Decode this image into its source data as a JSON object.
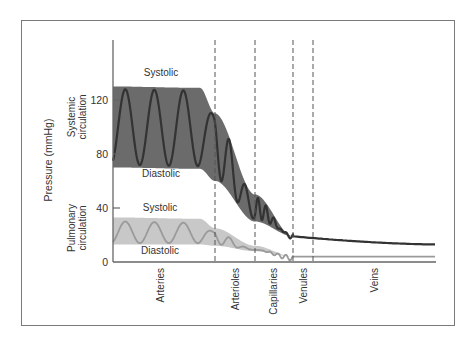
{
  "chart_data": {
    "type": "area",
    "title": "",
    "ylabel": "Pressure (mmHg)",
    "xlabel": "",
    "ylim": [
      0,
      160
    ],
    "yticks": [
      0,
      40,
      80,
      120
    ],
    "grid": false,
    "regions": [
      "Arteries",
      "Arterioles",
      "Capillaries",
      "Venules",
      "Veins"
    ],
    "region_boundaries_px": [
      113,
      215,
      255,
      293,
      313,
      436
    ],
    "group_labels": [
      {
        "text": "Systemic circulation",
        "lines": [
          "Systemic",
          "circulation"
        ]
      },
      {
        "text": "Pulmonary circulation",
        "lines": [
          "Pulmonary",
          "circulation"
        ]
      }
    ],
    "series": [
      {
        "name": "Systemic circulation",
        "color": "#6b6b6b",
        "line_color": "#333333",
        "systolic_label": "Systolic",
        "diastolic_label": "Diastolic",
        "x": [
          "Arteries",
          "Arteries (end)",
          "Arterioles",
          "Capillaries",
          "Venules",
          "Veins"
        ],
        "systolic": [
          130,
          129,
          110,
          50,
          19,
          13
        ],
        "diastolic": [
          70,
          69,
          60,
          30,
          19,
          13
        ],
        "mean_endpoint_veins": 13
      },
      {
        "name": "Pulmonary circulation",
        "color": "#c8c8c8",
        "line_color": "#9a9a9a",
        "systolic_label": "Systolic",
        "diastolic_label": "Diastolic",
        "x": [
          "Arteries",
          "Arteries (end)",
          "Arterioles",
          "Capillaries",
          "Venules",
          "Veins"
        ],
        "systolic": [
          33,
          32,
          25,
          12,
          4,
          4
        ],
        "diastolic": [
          13,
          13,
          12,
          8,
          4,
          4
        ]
      }
    ]
  }
}
